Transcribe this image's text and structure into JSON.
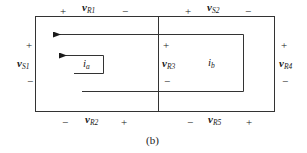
{
  "diagram": {
    "caption": "(b)",
    "type": "circuit-mesh",
    "elements": {
      "vR1": {
        "main": "v",
        "sub": "R1",
        "plus": "+",
        "minus": "−"
      },
      "vS2": {
        "main": "v",
        "sub": "S2",
        "plus": "+",
        "minus": "−"
      },
      "vS1": {
        "main": "v",
        "sub": "S1",
        "plus": "+",
        "minus": "−"
      },
      "vR3": {
        "main": "v",
        "sub": "R3",
        "plus": "+",
        "minus": "−"
      },
      "vR4": {
        "main": "v",
        "sub": "R4",
        "plus": "+",
        "minus": "−"
      },
      "vR2": {
        "main": "v",
        "sub": "R2",
        "plus": "+",
        "minus": "−"
      },
      "vR5": {
        "main": "v",
        "sub": "R5",
        "plus": "+",
        "minus": "−"
      }
    },
    "currents": {
      "ia": {
        "main": "i",
        "sub": "a"
      },
      "ib": {
        "main": "i",
        "sub": "b"
      }
    },
    "colors": {
      "line": "#333333",
      "text": "#1a1a1a"
    }
  }
}
